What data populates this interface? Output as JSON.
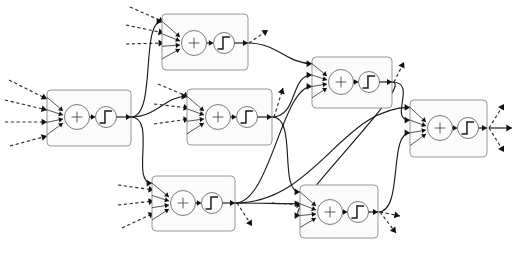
{
  "figure": {
    "kind": "diagram",
    "background_color": "#ffffff",
    "width": 516,
    "height": 255,
    "edge_color": "#1a1a1a",
    "node_fill": "#fbfbfb",
    "node_stroke": "#8c8c8c",
    "arrow_color": "#111111"
  },
  "legend": {
    "sum_symbol": "+",
    "activation_symbol": "step-function",
    "solid_edge_meaning": "internal weighted connection",
    "dashed_edge_meaning": "external input / output signal"
  },
  "nodes": [
    {
      "id": "n1",
      "name": "neuron-input-left",
      "layer": 1,
      "box": {
        "x": 47,
        "y": 90,
        "w": 84,
        "h": 56
      },
      "sum": {
        "cx": 77,
        "cy": 117,
        "r": 12.5,
        "label": "+"
      },
      "activation": {
        "cx": 106,
        "cy": 117,
        "r": 10.5,
        "label": "step-function"
      },
      "in_count": 4,
      "out_count": 3
    },
    {
      "id": "n2",
      "name": "neuron-hidden-top",
      "layer": 2,
      "box": {
        "x": 162,
        "y": 14,
        "w": 86,
        "h": 56
      },
      "sum": {
        "cx": 194,
        "cy": 43,
        "r": 12.5,
        "label": "+"
      },
      "activation": {
        "cx": 224,
        "cy": 43,
        "r": 10.5,
        "label": "step-function"
      },
      "in_count": 4,
      "out_count": 2
    },
    {
      "id": "n3",
      "name": "neuron-hidden-middle",
      "layer": 2,
      "box": {
        "x": 187,
        "y": 89,
        "w": 85,
        "h": 56
      },
      "sum": {
        "cx": 218,
        "cy": 117,
        "r": 12.5,
        "label": "+"
      },
      "activation": {
        "cx": 247,
        "cy": 117,
        "r": 10.5,
        "label": "step-function"
      },
      "in_count": 4,
      "out_count": 3
    },
    {
      "id": "n4",
      "name": "neuron-hidden-bottom",
      "layer": 2,
      "box": {
        "x": 152,
        "y": 176,
        "w": 83,
        "h": 55
      },
      "sum": {
        "cx": 183,
        "cy": 203,
        "r": 12.5,
        "label": "+"
      },
      "activation": {
        "cx": 212,
        "cy": 203,
        "r": 10.5,
        "label": "step-function"
      },
      "in_count": 4,
      "out_count": 4
    },
    {
      "id": "n5",
      "name": "neuron-deep-top",
      "layer": 3,
      "box": {
        "x": 312,
        "y": 57,
        "w": 80,
        "h": 51
      },
      "sum": {
        "cx": 341,
        "cy": 82,
        "r": 12.5,
        "label": "+"
      },
      "activation": {
        "cx": 369,
        "cy": 82,
        "r": 10.5,
        "label": "step-function"
      },
      "in_count": 4,
      "out_count": 3
    },
    {
      "id": "n6",
      "name": "neuron-deep-bottom",
      "layer": 3,
      "box": {
        "x": 300,
        "y": 185,
        "w": 78,
        "h": 53
      },
      "sum": {
        "cx": 330,
        "cy": 212,
        "r": 12.5,
        "label": "+"
      },
      "activation": {
        "cx": 358,
        "cy": 212,
        "r": 10.5,
        "label": "step-function"
      },
      "in_count": 4,
      "out_count": 3
    },
    {
      "id": "n7",
      "name": "neuron-output",
      "layer": 4,
      "box": {
        "x": 410,
        "y": 100,
        "w": 77,
        "h": 57
      },
      "sum": {
        "cx": 440,
        "cy": 128,
        "r": 12.5,
        "label": "+"
      },
      "activation": {
        "cx": 468,
        "cy": 128,
        "r": 10.5,
        "label": "step-function"
      },
      "in_count": 4,
      "out_count": 3
    }
  ],
  "external_inputs": [
    {
      "name": "input-arrow-n1-1",
      "from": [
        9,
        80
      ],
      "to": [
        47,
        99
      ]
    },
    {
      "name": "input-arrow-n1-2",
      "from": [
        5,
        100
      ],
      "to": [
        47,
        110
      ]
    },
    {
      "name": "input-arrow-n1-3",
      "from": [
        5,
        122
      ],
      "to": [
        47,
        122
      ]
    },
    {
      "name": "input-arrow-n1-4",
      "from": [
        10,
        146
      ],
      "to": [
        47,
        136
      ]
    },
    {
      "name": "input-arrow-n2-1",
      "from": [
        130,
        7
      ],
      "to": [
        164,
        22
      ]
    },
    {
      "name": "input-arrow-n2-2",
      "from": [
        126,
        25
      ],
      "to": [
        164,
        33
      ]
    },
    {
      "name": "input-arrow-n2-3",
      "from": [
        126,
        44
      ],
      "to": [
        164,
        43
      ]
    },
    {
      "name": "input-arrow-n3-1",
      "from": [
        158,
        84
      ],
      "to": [
        189,
        97
      ]
    },
    {
      "name": "input-arrow-n3-2",
      "from": [
        154,
        104
      ],
      "to": [
        189,
        108
      ]
    },
    {
      "name": "input-arrow-n3-3",
      "from": [
        154,
        124
      ],
      "to": [
        189,
        119
      ]
    },
    {
      "name": "input-arrow-n4-1",
      "from": [
        118,
        185
      ],
      "to": [
        154,
        190
      ]
    },
    {
      "name": "input-arrow-n4-2",
      "from": [
        118,
        205
      ],
      "to": [
        154,
        201
      ]
    },
    {
      "name": "input-arrow-n4-3",
      "from": [
        122,
        228
      ],
      "to": [
        154,
        213
      ]
    },
    {
      "name": "input-arrow-n6-1",
      "from": [
        272,
        203
      ],
      "to": [
        302,
        205
      ]
    }
  ],
  "external_outputs": [
    {
      "name": "output-arrow-n2-up",
      "from": [
        249,
        43
      ],
      "to": [
        268,
        30
      ]
    },
    {
      "name": "output-arrow-n3-up",
      "from": [
        274,
        117
      ],
      "to": [
        283,
        88
      ]
    },
    {
      "name": "output-arrow-n4-down",
      "from": [
        237,
        203
      ],
      "to": [
        252,
        226
      ]
    },
    {
      "name": "output-arrow-n5-up",
      "from": [
        394,
        82
      ],
      "to": [
        404,
        62
      ]
    },
    {
      "name": "output-arrow-n6-right",
      "from": [
        380,
        212
      ],
      "to": [
        400,
        216
      ]
    },
    {
      "name": "output-arrow-n6-down",
      "from": [
        380,
        212
      ],
      "to": [
        396,
        233
      ]
    },
    {
      "name": "output-arrow-n7-up",
      "from": [
        489,
        128
      ],
      "to": [
        504,
        104
      ]
    },
    {
      "name": "output-arrow-n7-right",
      "from": [
        489,
        128
      ],
      "to": [
        512,
        128
      ]
    },
    {
      "name": "output-arrow-n7-down",
      "from": [
        489,
        128
      ],
      "to": [
        504,
        152
      ]
    }
  ],
  "connections": [
    {
      "name": "edge-n1-n2",
      "from": "n1",
      "to": "n2"
    },
    {
      "name": "edge-n1-n3",
      "from": "n1",
      "to": "n3"
    },
    {
      "name": "edge-n1-n4",
      "from": "n1",
      "to": "n4"
    },
    {
      "name": "edge-n2-n5",
      "from": "n2",
      "to": "n5"
    },
    {
      "name": "edge-n3-n5",
      "from": "n3",
      "to": "n5"
    },
    {
      "name": "edge-n3-n6",
      "from": "n3",
      "to": "n6"
    },
    {
      "name": "edge-n4-n5",
      "from": "n4",
      "to": "n5"
    },
    {
      "name": "edge-n4-n6",
      "from": "n4",
      "to": "n6"
    },
    {
      "name": "edge-n4-n7",
      "from": "n4",
      "to": "n7"
    },
    {
      "name": "edge-n5-n7",
      "from": "n5",
      "to": "n7"
    },
    {
      "name": "edge-n5-n6",
      "from": "n5",
      "to": "n6"
    },
    {
      "name": "edge-n6-n7",
      "from": "n6",
      "to": "n7"
    }
  ]
}
